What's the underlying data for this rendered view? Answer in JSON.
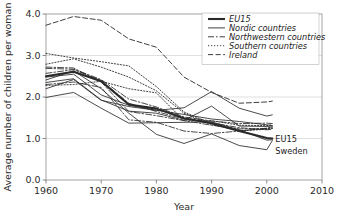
{
  "chart_data": {
    "type": "line",
    "title": "",
    "xlabel": "Year",
    "ylabel": "Average number of children per woman",
    "xlim": [
      1960,
      2010
    ],
    "ylim": [
      0.0,
      4.0
    ],
    "xticks": [
      "1960",
      "1970",
      "1980",
      "1990",
      "2000",
      "2010"
    ],
    "xtick_values": [
      1960,
      1970,
      1980,
      1990,
      2000,
      2010
    ],
    "yticks": [
      "0.0",
      "1.0",
      "2.0",
      "3.0",
      "4.0"
    ],
    "ytick_values": [
      0.0,
      1.0,
      2.0,
      3.0,
      4.0
    ],
    "grid": "horizontal",
    "legend_position": "top-right",
    "x": [
      1960,
      1965,
      1970,
      1975,
      1980,
      1985,
      1990,
      1995,
      2000,
      2001
    ],
    "series": [
      {
        "name": "EU15",
        "style": "thick-solid",
        "width": 2.1,
        "dash": "",
        "values": [
          2.5,
          2.61,
          2.38,
          1.82,
          1.72,
          1.49,
          1.37,
          1.18,
          1.01,
          1.0
        ]
      },
      {
        "name": "Nordic countries",
        "style": "solid",
        "width": 0.85,
        "dash": "",
        "values": [
          2.48,
          2.55,
          2.05,
          1.8,
          1.68,
          1.58,
          1.47,
          1.41,
          1.33,
          1.31
        ]
      },
      {
        "name": "Nordic countries",
        "style": "solid",
        "width": 0.85,
        "dash": "",
        "values": [
          2.35,
          2.44,
          1.93,
          1.66,
          1.61,
          1.44,
          1.78,
          1.3,
          1.29,
          1.3
        ]
      },
      {
        "name": "Sweden",
        "style": "solid",
        "width": 0.85,
        "dash": "",
        "values": [
          2.2,
          2.42,
          1.92,
          1.77,
          1.68,
          1.74,
          2.13,
          1.73,
          1.54,
          1.57
        ]
      },
      {
        "name": "Sweden",
        "style": "solid",
        "width": 0.85,
        "dash": "",
        "values": [
          1.99,
          2.11,
          1.73,
          1.37,
          1.38,
          1.39,
          1.4,
          1.21,
          0.96,
          0.97
        ]
      },
      {
        "name": "Sweden-low",
        "style": "solid",
        "width": 0.85,
        "dash": "",
        "values": [
          2.41,
          2.63,
          2.2,
          1.61,
          1.1,
          0.88,
          1.11,
          0.83,
          0.73,
          0.95
        ]
      },
      {
        "name": "Northwestern countries",
        "style": "dash-dot",
        "width": 0.85,
        "dash": "6 2 1.6 2",
        "values": [
          2.57,
          2.66,
          2.4,
          1.85,
          1.65,
          1.47,
          1.38,
          1.26,
          1.21,
          1.22
        ]
      },
      {
        "name": "Northwestern countries",
        "style": "dash-dot",
        "width": 0.85,
        "dash": "6 2 1.6 2",
        "values": [
          2.72,
          2.7,
          2.36,
          1.65,
          1.55,
          1.43,
          1.32,
          1.23,
          1.24,
          1.25
        ]
      },
      {
        "name": "Northwestern countries",
        "style": "dash-dot",
        "width": 0.85,
        "dash": "6 2 1.6 2",
        "values": [
          2.3,
          2.36,
          2.23,
          1.45,
          1.39,
          1.18,
          1.12,
          1.18,
          1.25,
          1.28
        ]
      },
      {
        "name": "Northwestern countries",
        "style": "dash-dot",
        "width": 0.85,
        "dash": "6 2 1.6 2",
        "values": [
          2.69,
          2.67,
          2.42,
          1.95,
          1.76,
          1.52,
          1.42,
          1.36,
          1.37,
          1.36
        ]
      },
      {
        "name": "Southern countries",
        "style": "dotted",
        "width": 0.9,
        "dash": "1.2 1.8",
        "values": [
          3.05,
          2.94,
          2.85,
          2.75,
          2.25,
          1.64,
          1.36,
          1.18,
          1.24,
          1.26
        ]
      },
      {
        "name": "Southern countries",
        "style": "dotted",
        "width": 0.9,
        "dash": "1.2 1.8",
        "values": [
          2.79,
          2.92,
          2.72,
          2.48,
          2.15,
          1.61,
          1.33,
          1.19,
          1.22,
          1.24
        ]
      },
      {
        "name": "Southern countries",
        "style": "dotted",
        "width": 0.9,
        "dash": "1.2 1.8",
        "values": [
          2.28,
          2.3,
          2.38,
          2.2,
          2.1,
          1.43,
          1.43,
          1.32,
          1.31,
          1.33
        ]
      },
      {
        "name": "Ireland",
        "style": "long-dash",
        "width": 0.9,
        "dash": "5 2.6",
        "values": [
          3.73,
          3.94,
          3.85,
          3.4,
          3.2,
          2.48,
          2.11,
          1.85,
          1.88,
          1.9
        ]
      }
    ],
    "legend": [
      {
        "label": "EU15",
        "style": "thick-solid",
        "dash": "",
        "width": 2.1
      },
      {
        "label": "Nordic countries",
        "style": "solid",
        "dash": "",
        "width": 0.9
      },
      {
        "label": "Northwestern countries",
        "style": "dash-dot",
        "dash": "6 2 1.6 2",
        "width": 0.9
      },
      {
        "label": "Southern countries",
        "style": "dotted",
        "dash": "1.2 1.8",
        "width": 0.9
      },
      {
        "label": "Ireland",
        "style": "long-dash",
        "dash": "5 2.6",
        "width": 0.9
      }
    ],
    "annotations": [
      {
        "label": "EU15",
        "x": 2001,
        "y": 1.0
      },
      {
        "label": "Sweden",
        "x": 2001,
        "y": 0.7
      }
    ]
  }
}
